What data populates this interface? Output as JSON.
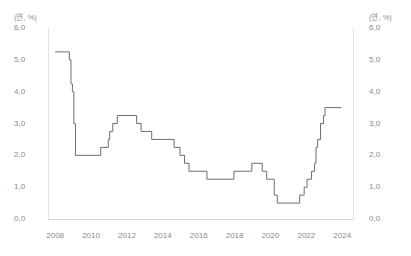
{
  "axis": {
    "unit_label_left": "(연, %)",
    "unit_label_right": "(연, %)",
    "y_ticks": [
      "6,0",
      "5,0",
      "4,0",
      "3,0",
      "2,0",
      "1,0",
      "0,0"
    ],
    "x_ticks": [
      "2008",
      "2010",
      "2012",
      "2014",
      "2016",
      "2018",
      "2020",
      "2022",
      "2024"
    ]
  },
  "style": {
    "line_color": "#6e6e6e",
    "frame_color": "#e3e3e3",
    "text_color": "#8a8a8a",
    "background": "#ffffff"
  },
  "chart_data": {
    "type": "line",
    "title": "",
    "subtitle": "",
    "xlabel": "",
    "ylabel": "(연, %)",
    "unit": "(연, %)",
    "step": "post",
    "grid": false,
    "legend": false,
    "xlim": [
      2007.6,
      2024.6
    ],
    "ylim": [
      0.0,
      6.0
    ],
    "y_tick_values": [
      6.0,
      5.0,
      4.0,
      3.0,
      2.0,
      1.0,
      0.0
    ],
    "x_tick_values": [
      2008,
      2010,
      2012,
      2014,
      2016,
      2018,
      2020,
      2022,
      2024
    ],
    "series": [
      {
        "name": "기준금리",
        "x": [
          2008.0,
          2008.58,
          2008.79,
          2008.88,
          2008.96,
          2009.04,
          2009.13,
          2010.54,
          2010.96,
          2011.04,
          2011.21,
          2011.46,
          2012.54,
          2012.79,
          2013.38,
          2014.63,
          2014.96,
          2015.21,
          2015.46,
          2016.46,
          2017.96,
          2018.96,
          2019.54,
          2019.79,
          2020.21,
          2020.38,
          2021.63,
          2021.88,
          2022.04,
          2022.29,
          2022.46,
          2022.54,
          2022.63,
          2022.79,
          2022.96,
          2023.04,
          2023.96
        ],
        "y": [
          5.25,
          5.25,
          5.0,
          4.25,
          4.0,
          3.0,
          2.0,
          2.25,
          2.5,
          2.75,
          3.0,
          3.25,
          3.0,
          2.75,
          2.5,
          2.25,
          2.0,
          1.75,
          1.5,
          1.25,
          1.5,
          1.75,
          1.5,
          1.25,
          0.75,
          0.5,
          0.75,
          1.0,
          1.25,
          1.5,
          1.75,
          2.25,
          2.5,
          3.0,
          3.25,
          3.5,
          3.5
        ]
      }
    ]
  }
}
